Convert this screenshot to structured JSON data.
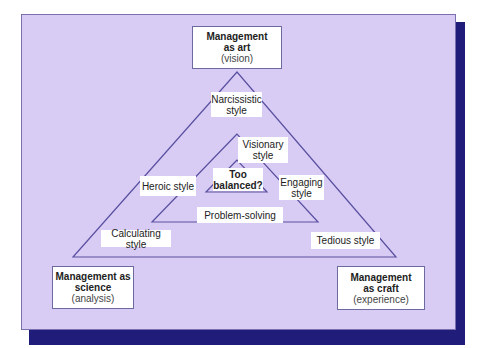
{
  "corners": {
    "art": {
      "title_line1": "Management",
      "title_line2": "as art",
      "subtitle": "(vision)"
    },
    "science": {
      "title_line1": "Management as",
      "title_line2": "science",
      "subtitle": "(analysis)"
    },
    "craft": {
      "title_line1": "Management",
      "title_line2": "as craft",
      "subtitle": "(experience)"
    }
  },
  "styles": {
    "narcissistic": {
      "line1": "Narcissistic",
      "line2": "style"
    },
    "visionary": {
      "line1": "Visionary",
      "line2": "style"
    },
    "too_balanced": {
      "line1": "Too",
      "line2": "balanced?"
    },
    "heroic": "Heroic style",
    "engaging": {
      "line1": "Engaging",
      "line2": "style"
    },
    "problem_solving": "Problem-solving",
    "calculating": "Calculating style",
    "tedious": "Tedious style"
  },
  "colors": {
    "panel": "#d8ccf5",
    "shadow": "#1f1c7a",
    "lines": "#5a50a0"
  }
}
